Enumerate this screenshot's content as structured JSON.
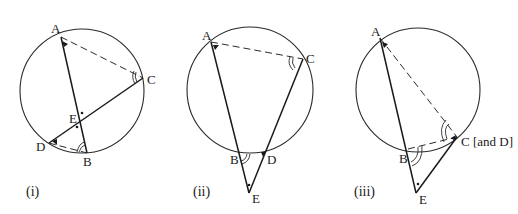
{
  "figures": [
    {
      "caption": "(i)",
      "points": {
        "A": "A",
        "B": "B",
        "C": "C",
        "D": "D",
        "E": "E"
      },
      "description": "Chords AB and CD intersect at E inside the circle; dashed AC and DB"
    },
    {
      "caption": "(ii)",
      "points": {
        "A": "A",
        "B": "B",
        "C": "C",
        "D": "D",
        "E": "E"
      },
      "description": "Secants AB and CD extended meet at E outside the circle; dashed AC"
    },
    {
      "caption": "(iii)",
      "points": {
        "A": "A",
        "B": "B",
        "C": "C [and D]",
        "E": "E"
      },
      "description": "Secant AB and tangent at C meet at E outside; dashed AC and BC"
    }
  ],
  "colors": {
    "ink": "#1a1a1a",
    "background": "#ffffff"
  }
}
